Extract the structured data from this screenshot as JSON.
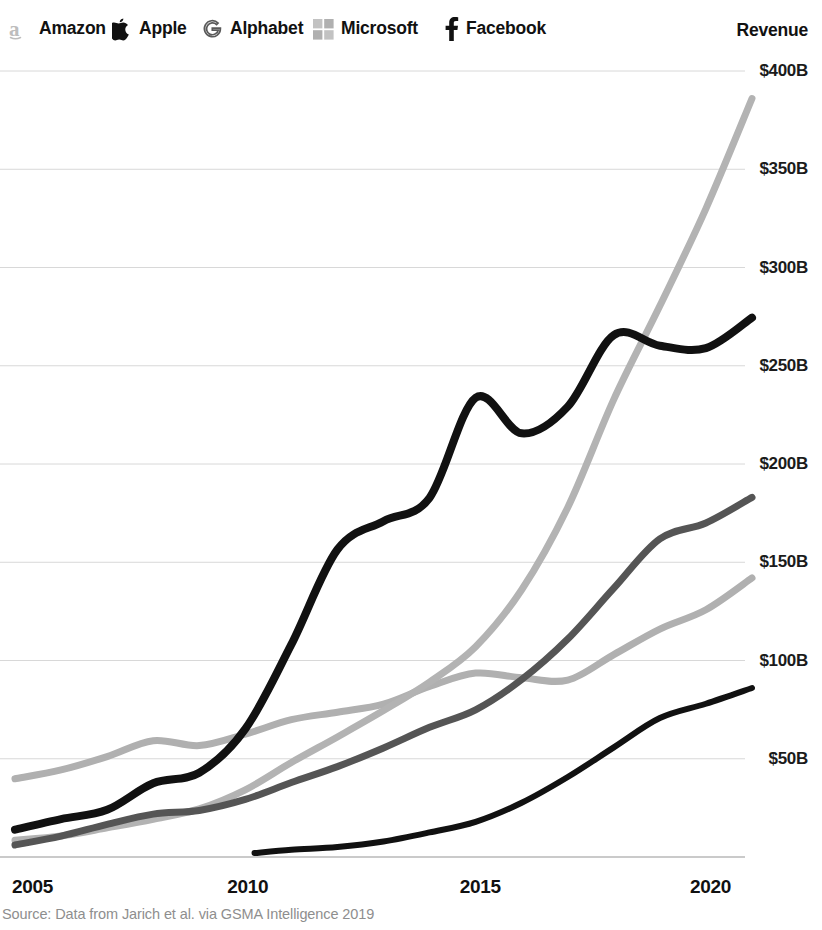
{
  "legend": {
    "revenue_title": "Revenue",
    "items": [
      {
        "label": "Amazon",
        "icon": "amazon-logo-icon",
        "color": "#b3b3b3",
        "x": 8
      },
      {
        "label": "Apple",
        "icon": "apple-logo-icon",
        "color": "#111111",
        "x": 112
      },
      {
        "label": "Alphabet",
        "icon": "alphabet-g-logo-icon",
        "color": "#555555",
        "x": 201
      },
      {
        "label": "Microsoft",
        "icon": "microsoft-logo-icon",
        "color": "#b0b0b0",
        "x": 313
      },
      {
        "label": "Facebook",
        "icon": "facebook-f-logo-icon",
        "color": "#111111",
        "x": 443
      }
    ]
  },
  "footer": {
    "source": "Source: Data from Jarich et al. via GSMA Intelligence 2019"
  },
  "chart_data": {
    "type": "line",
    "title": "Revenue",
    "xlabel": "",
    "ylabel": "Revenue",
    "xlim": [
      2005,
      2021
    ],
    "ylim": [
      0,
      400
    ],
    "grid": true,
    "legend_position": "top",
    "xticks": [
      2005,
      2010,
      2015,
      2020
    ],
    "xtick_labels": [
      "2005",
      "2010",
      "2015",
      "2020"
    ],
    "yticks": [
      50,
      100,
      150,
      200,
      250,
      300,
      350,
      400
    ],
    "ytick_labels": [
      "$50B",
      "$100B",
      "$150B",
      "$200B",
      "$250B",
      "$300B",
      "$350B",
      "$400B"
    ],
    "units": "Billions of USD",
    "series": [
      {
        "name": "Amazon",
        "color": "#b3b3b3",
        "width": 7,
        "x": [
          2005,
          2006,
          2007,
          2008,
          2009,
          2010,
          2011,
          2012,
          2013,
          2014,
          2015,
          2016,
          2017,
          2018,
          2019,
          2020,
          2021
        ],
        "values": [
          8.5,
          10.7,
          14.8,
          19.2,
          24.5,
          34.2,
          48.1,
          61.1,
          74.5,
          89.0,
          107.0,
          136.0,
          177.9,
          232.9,
          280.5,
          330.0,
          386.0
        ]
      },
      {
        "name": "Apple",
        "color": "#111111",
        "width": 8,
        "x": [
          2005,
          2006,
          2007,
          2008,
          2009,
          2010,
          2011,
          2012,
          2013,
          2014,
          2015,
          2016,
          2017,
          2018,
          2019,
          2020,
          2021
        ],
        "values": [
          13.9,
          19.3,
          24.0,
          37.5,
          42.9,
          65.2,
          108.2,
          156.5,
          170.9,
          182.8,
          233.7,
          215.6,
          229.2,
          265.6,
          260.2,
          259.0,
          274.5
        ]
      },
      {
        "name": "Alphabet",
        "color": "#555555",
        "width": 7,
        "x": [
          2005,
          2006,
          2007,
          2008,
          2009,
          2010,
          2011,
          2012,
          2013,
          2014,
          2015,
          2016,
          2017,
          2018,
          2019,
          2020,
          2021
        ],
        "values": [
          6.1,
          10.6,
          16.6,
          21.8,
          23.7,
          29.3,
          37.9,
          46.0,
          55.5,
          66.0,
          74.9,
          90.3,
          110.9,
          136.8,
          161.9,
          170.0,
          183.0
        ]
      },
      {
        "name": "Microsoft",
        "color": "#b0b0b0",
        "width": 7,
        "x": [
          2005,
          2006,
          2007,
          2008,
          2009,
          2010,
          2011,
          2012,
          2013,
          2014,
          2015,
          2016,
          2017,
          2018,
          2019,
          2020,
          2021
        ],
        "values": [
          39.8,
          44.3,
          51.1,
          59.2,
          56.7,
          62.5,
          69.9,
          73.7,
          77.8,
          86.8,
          93.6,
          91.2,
          90.0,
          103.0,
          116.0,
          125.8,
          142.0
        ]
      },
      {
        "name": "Facebook",
        "color": "#111111",
        "width": 6,
        "x": [
          2010.2,
          2011,
          2012,
          2013,
          2014,
          2015,
          2016,
          2017,
          2018,
          2019,
          2020,
          2021
        ],
        "values": [
          2.0,
          3.7,
          5.1,
          7.9,
          12.5,
          17.9,
          27.6,
          40.7,
          55.8,
          70.7,
          78.0,
          86.0
        ]
      }
    ]
  }
}
